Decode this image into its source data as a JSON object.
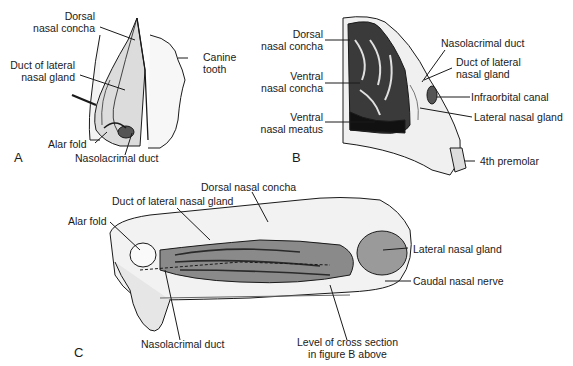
{
  "figure": {
    "panels": {
      "A": {
        "letter": "A",
        "labels": {
          "dorsal_nasal_concha": [
            "Dorsal",
            "nasal concha"
          ],
          "duct_lateral_nasal_gland": [
            "Duct of lateral",
            "nasal gland"
          ],
          "canine_tooth": [
            "Canine",
            "tooth"
          ],
          "alar_fold": "Alar fold",
          "nasolacrimal_duct": "Nasolacrimal duct"
        }
      },
      "B": {
        "letter": "B",
        "labels": {
          "dorsal_nasal_concha": [
            "Dorsal",
            "nasal concha"
          ],
          "ventral_nasal_concha": [
            "Ventral",
            "nasal concha"
          ],
          "ventral_nasal_meatus": [
            "Ventral",
            "nasal meatus"
          ],
          "nasolacrimal_duct": "Nasolacrimal duct",
          "duct_lateral_nasal_gland": [
            "Duct of lateral",
            "nasal gland"
          ],
          "infraorbital_canal": "Infraorbital canal",
          "lateral_nasal_gland": "Lateral nasal gland",
          "fourth_premolar": "4th premolar"
        }
      },
      "C": {
        "letter": "C",
        "labels": {
          "dorsal_nasal_concha": "Dorsal nasal concha",
          "duct_lateral_nasal_gland": "Duct of lateral nasal gland",
          "alar_fold": "Alar fold",
          "lateral_nasal_gland": "Lateral nasal gland",
          "caudal_nasal_nerve": "Caudal nasal nerve",
          "nasolacrimal_duct": "Nasolacrimal duct",
          "level_cross_section": [
            "Level of cross section",
            "in figure B above"
          ]
        }
      }
    },
    "colors": {
      "ink": "#1a1a1a",
      "shade": "#9a9a9a",
      "light": "#e6e6e6",
      "bg": "#ffffff"
    }
  }
}
